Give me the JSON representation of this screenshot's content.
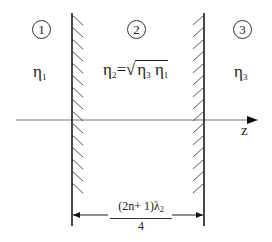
{
  "diagram": {
    "regions": [
      {
        "number": "1",
        "medium_label": "η",
        "medium_sub": "1"
      },
      {
        "number": "2",
        "medium_label": "η",
        "medium_sub": "2",
        "equation_rhs_a": "η",
        "equation_rhs_a_sub": "3",
        "equation_rhs_b": "η",
        "equation_rhs_b_sub": "1",
        "equals": "=",
        "sqrt_sign": "√"
      },
      {
        "number": "3",
        "medium_label": "η",
        "medium_sub": "3"
      }
    ],
    "axis": {
      "label": "z"
    },
    "dimension": {
      "numerator_pre": "(2n+ 1)λ",
      "numerator_sub": "2",
      "denominator": "4"
    },
    "colors": {
      "line": "#1a1a1a",
      "hatch": "#444444",
      "axis": "#666666"
    }
  }
}
